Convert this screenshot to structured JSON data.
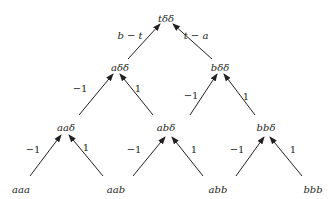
{
  "diagram": {
    "type": "tree",
    "colors": {
      "ink": "#231f20",
      "background": "#ffffff"
    },
    "nodes": {
      "root": {
        "label": "tδδ",
        "x": 166,
        "y": 22
      },
      "a_dd": {
        "label": "aδδ",
        "x": 120,
        "y": 71
      },
      "b_dd": {
        "label": "bδδ",
        "x": 220,
        "y": 71
      },
      "aa_d": {
        "label": "aaδ",
        "x": 66,
        "y": 131
      },
      "ab_d": {
        "label": "abδ",
        "x": 166,
        "y": 131
      },
      "bb_d": {
        "label": "bbδ",
        "x": 266,
        "y": 131
      },
      "aaa": {
        "label": "aaa",
        "x": 21,
        "y": 193
      },
      "aab": {
        "label": "aab",
        "x": 116,
        "y": 193
      },
      "abb": {
        "label": "abb",
        "x": 218,
        "y": 193
      },
      "bbb": {
        "label": "bbb",
        "x": 313,
        "y": 193
      }
    },
    "edges": [
      {
        "from": "a_dd",
        "to": "root",
        "label": "b − t",
        "italic": true,
        "x1": 128,
        "y1": 59,
        "x2": 160,
        "y2": 24,
        "lx": 130,
        "ly": 39
      },
      {
        "from": "b_dd",
        "to": "root",
        "label": "t − a",
        "italic": true,
        "x1": 212,
        "y1": 59,
        "x2": 173,
        "y2": 24,
        "lx": 196,
        "ly": 39
      },
      {
        "from": "aa_d",
        "to": "a_dd",
        "label": "−1",
        "italic": false,
        "x1": 79,
        "y1": 115,
        "x2": 113,
        "y2": 74,
        "lx": 80,
        "ly": 92
      },
      {
        "from": "ab_d",
        "to": "a_dd",
        "label": "1",
        "italic": false,
        "x1": 153,
        "y1": 115,
        "x2": 120,
        "y2": 74,
        "lx": 138,
        "ly": 92
      },
      {
        "from": "ab_d",
        "to": "b_dd",
        "label": "−1",
        "italic": false,
        "x1": 190,
        "y1": 115,
        "x2": 217,
        "y2": 74,
        "lx": 191,
        "ly": 99
      },
      {
        "from": "bb_d",
        "to": "b_dd",
        "label": "1",
        "italic": false,
        "x1": 255,
        "y1": 115,
        "x2": 224,
        "y2": 74,
        "lx": 246,
        "ly": 100
      },
      {
        "from": "aaa",
        "to": "aa_d",
        "label": "−1",
        "italic": false,
        "x1": 30,
        "y1": 176,
        "x2": 61,
        "y2": 135,
        "lx": 33,
        "ly": 153
      },
      {
        "from": "aab",
        "to": "aa_d",
        "label": "1",
        "italic": false,
        "x1": 103,
        "y1": 176,
        "x2": 69,
        "y2": 135,
        "lx": 86,
        "ly": 151
      },
      {
        "from": "abb",
        "to": "ab_d",
        "label": "−1",
        "italic": false,
        "x1": 133,
        "y1": 176,
        "x2": 165,
        "y2": 137,
        "lx": 134,
        "ly": 153
      },
      {
        "from": "abb",
        "to": "ab_d",
        "label": "1",
        "italic": false,
        "x1": 203,
        "y1": 176,
        "x2": 172,
        "y2": 137,
        "lx": 194,
        "ly": 153
      },
      {
        "from": "bbb",
        "to": "bb_d",
        "label": "−1",
        "italic": false,
        "x1": 236,
        "y1": 176,
        "x2": 264,
        "y2": 137,
        "lx": 237,
        "ly": 153
      },
      {
        "from": "bbb",
        "to": "bb_d",
        "label": "1",
        "italic": false,
        "x1": 302,
        "y1": 176,
        "x2": 270,
        "y2": 137,
        "lx": 293,
        "ly": 153
      }
    ]
  }
}
